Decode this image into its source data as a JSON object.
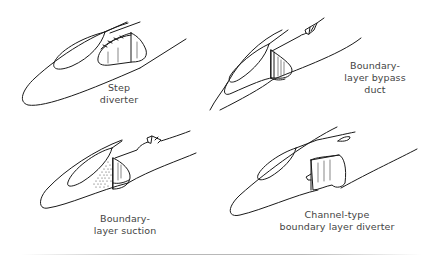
{
  "diagram": {
    "type": "illustration",
    "panels": [
      {
        "id": "step-diverter",
        "position": "top-left",
        "label_lines": [
          "Step",
          "diverter"
        ]
      },
      {
        "id": "boundary-layer-bypass-duct",
        "position": "top-right",
        "label_lines": [
          "Boundary-",
          "layer bypass",
          "duct"
        ]
      },
      {
        "id": "boundary-layer-suction",
        "position": "bottom-left",
        "label_lines": [
          "Boundary-",
          "layer suction"
        ]
      },
      {
        "id": "channel-type-boundary-layer-diverter",
        "position": "bottom-right",
        "label_lines": [
          "Channel-type",
          "boundary layer diverter"
        ]
      }
    ],
    "colors": {
      "line": "#1a1a1a",
      "text": "#444444",
      "hatch": "#555555",
      "rule": "#b8b8b8"
    }
  }
}
